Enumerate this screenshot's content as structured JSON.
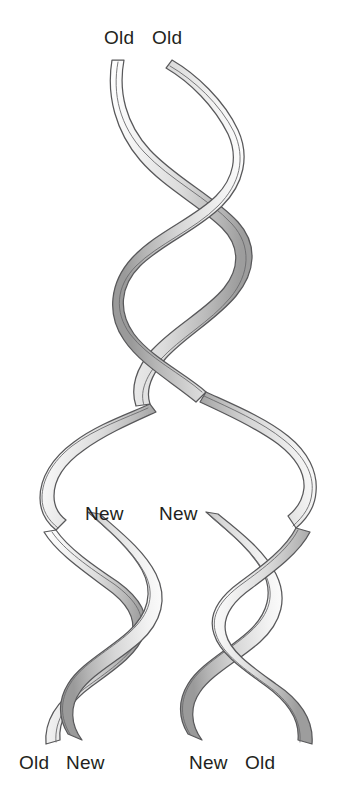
{
  "figure": {
    "background_color": "#ffffff",
    "width": 345,
    "height": 787
  },
  "style": {
    "ribbon_fill_light": "#f2f2f2",
    "ribbon_fill_mid": "#d9d9d9",
    "ribbon_fill_dark": "#a8a8a8",
    "ribbon_stroke": "#58585a",
    "label_color": "#231f20"
  },
  "labels": {
    "parent": {
      "left": "Old",
      "right": "Old"
    },
    "fork_new": {
      "left": "New",
      "right": "New"
    },
    "daughter_left": {
      "outer": "Old",
      "inner": "New"
    },
    "daughter_right": {
      "inner": "New",
      "outer": "Old"
    }
  },
  "structures": {
    "parent_helix": {
      "name": "parent-double-helix",
      "strand_count": 2,
      "turns": 2.5,
      "x_center": 180,
      "y_top": 58,
      "y_bottom": 375,
      "amplitude": 62
    },
    "replication_fork": {
      "name": "replication-fork",
      "y_start": 330,
      "y_end": 530,
      "branch_left_x": 92,
      "branch_right_x": 262
    },
    "daughter_left_helix": {
      "name": "daughter-helix-left",
      "strand_count": 2,
      "turns": 2,
      "x_center": 92,
      "y_top": 500,
      "y_bottom": 752,
      "amplitude": 56
    },
    "daughter_right_helix": {
      "name": "daughter-helix-right",
      "strand_count": 2,
      "turns": 2,
      "x_center": 260,
      "y_top": 500,
      "y_bottom": 752,
      "amplitude": 56
    }
  }
}
